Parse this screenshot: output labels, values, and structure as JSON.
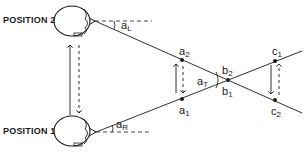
{
  "diagram": {
    "type": "binocular-geometry",
    "colors": {
      "ink": "#1a1a1a",
      "background": "#ffffff"
    },
    "positions": [
      {
        "id": "position-2",
        "label": "POSITION 2",
        "angle_label": "a",
        "angle_sub": "L"
      },
      {
        "id": "position-1",
        "label": "POSITION 1",
        "angle_label": "a",
        "angle_sub": "R"
      }
    ],
    "points": {
      "a2": {
        "base": "a",
        "sub": "2"
      },
      "a1": {
        "base": "a",
        "sub": "1"
      },
      "b2": {
        "base": "b",
        "sub": "2"
      },
      "b1": {
        "base": "b",
        "sub": "1"
      },
      "c1": {
        "base": "c",
        "sub": "1"
      },
      "c2": {
        "base": "c",
        "sub": "2"
      }
    },
    "angle_T": {
      "base": "a",
      "sub": "T"
    }
  }
}
